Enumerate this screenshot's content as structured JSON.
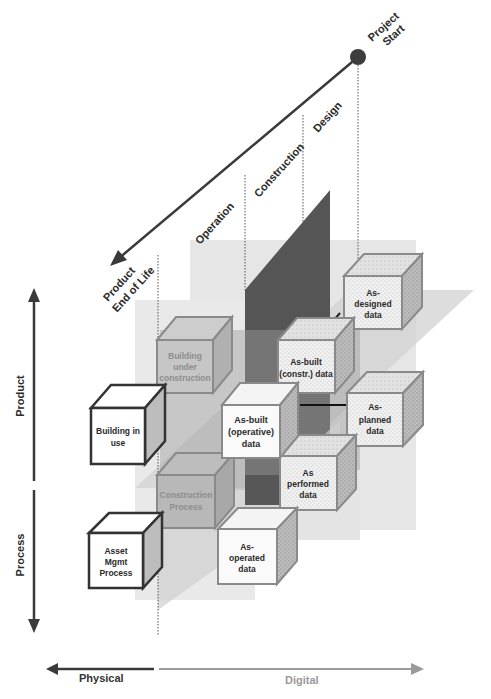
{
  "timeline": {
    "start_label_line1": "Project",
    "start_label_line2": "Start",
    "end_label_line1": "Product",
    "end_label_line2": "End of Life",
    "phases": [
      "Design",
      "Construction",
      "Operation"
    ]
  },
  "vertical_axis": {
    "top_label": "Product",
    "bottom_label": "Process"
  },
  "horizontal_axis": {
    "left_label": "Physical",
    "right_label": "Digital"
  },
  "cubes": {
    "building_under_construction": [
      "Building",
      "under",
      "construction"
    ],
    "construction_process": [
      "Construction",
      "Process"
    ],
    "building_in_use": [
      "Building in",
      "use"
    ],
    "asset_mgmt_process": [
      "Asset",
      "Mgmt",
      "Process"
    ],
    "as_built_operative": [
      "As-built",
      "(operative)",
      "data"
    ],
    "as_operated": [
      "As-",
      "operated",
      "data"
    ],
    "as_designed": [
      "As-",
      "designed",
      "data"
    ],
    "as_built_constr": [
      "As-built",
      "(constr.) data"
    ],
    "as_planned": [
      "As-",
      "planned",
      "data"
    ],
    "as_performed": [
      "As",
      "performed",
      "data"
    ]
  },
  "colors": {
    "dark_arrow": "#3a3a3a",
    "light_arrow": "#9a9a9a",
    "plane_light": "#e3e3e3",
    "plane_mid": "#c8c8c8",
    "plane_dark": "#5a5a5a",
    "cube_border_dark": "#333333",
    "cube_border_grey": "#8a8a8a"
  }
}
